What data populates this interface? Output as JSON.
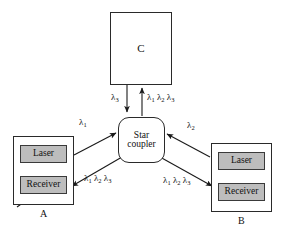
{
  "figure": {
    "background_color": "#ffffff",
    "line_color": "#1a1a1a",
    "fill_gray": "#bdbdbd"
  },
  "nodes": {
    "c": {
      "label": "C",
      "caption": ""
    },
    "coupler": {
      "line1": "Star",
      "line2": "coupler"
    },
    "a": {
      "caption": "A",
      "laser": "Laser",
      "receiver": "Receiver"
    },
    "b": {
      "caption": "B",
      "laser": "Laser",
      "receiver": "Receiver"
    }
  },
  "edge_labels": {
    "c_downlink": "λ3",
    "c_uplink": "λ1 λ2 λ3",
    "a_uplink": "λ1",
    "b_uplink": "λ2",
    "a_downlink": "λ1 λ2 λ3",
    "b_downlink": "λ1 λ2 λ3",
    "lambda_symbol": "λ",
    "sub1": "1",
    "sub2": "2",
    "sub3": "3"
  },
  "edges": [
    {
      "name": "coupler-to-c-down",
      "from": "C",
      "to": "Star coupler",
      "label": "λ3",
      "direction": "down"
    },
    {
      "name": "coupler-to-c-up",
      "from": "Star coupler",
      "to": "C",
      "label": "λ1 λ2 λ3",
      "direction": "up"
    },
    {
      "name": "a-to-coupler",
      "from": "A",
      "to": "Star coupler",
      "label": "λ1",
      "direction": "up-right"
    },
    {
      "name": "b-to-coupler",
      "from": "B",
      "to": "Star coupler",
      "label": "λ2",
      "direction": "up-left"
    },
    {
      "name": "coupler-to-a",
      "from": "Star coupler",
      "to": "A receiver",
      "label": "λ1 λ2 λ3",
      "direction": "down-left"
    },
    {
      "name": "coupler-to-b",
      "from": "Star coupler",
      "to": "B receiver",
      "label": "λ1 λ2 λ3",
      "direction": "down-right"
    }
  ]
}
